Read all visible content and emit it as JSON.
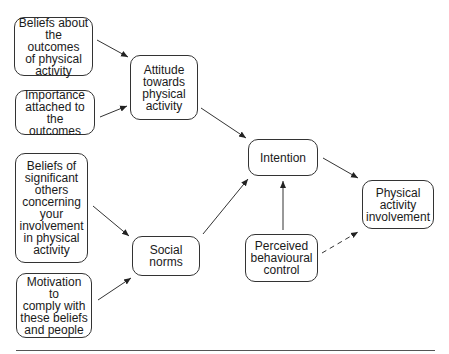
{
  "diagram": {
    "type": "flow diagram (Theory of Planned Behaviour applied to physical activity)",
    "nodes": {
      "beliefs_outcomes": {
        "label": "Beliefs about\nthe outcomes\nof physical\nactivity"
      },
      "importance": {
        "label": "Importance\nattached to\nthe outcomes"
      },
      "attitude": {
        "label": "Attitude\ntowards\nphysical\nactivity"
      },
      "beliefs_others": {
        "label": "Beliefs of\nsignificant\nothers\nconcerning\nyour\ninvolvement\nin physical\nactivity"
      },
      "motivation": {
        "label": "Motivation to\ncomply with\nthese beliefs\nand people"
      },
      "social_norms": {
        "label": "Social\nnorms"
      },
      "intention": {
        "label": "Intention"
      },
      "perceived_control": {
        "label": "Perceived\nbehavioural\ncontrol"
      },
      "involvement": {
        "label": "Physical\nactivity\ninvolvement"
      }
    },
    "edges": [
      {
        "from": "beliefs_outcomes",
        "to": "attitude",
        "style": "solid"
      },
      {
        "from": "importance",
        "to": "attitude",
        "style": "solid"
      },
      {
        "from": "beliefs_others",
        "to": "social_norms",
        "style": "solid"
      },
      {
        "from": "motivation",
        "to": "social_norms",
        "style": "solid"
      },
      {
        "from": "attitude",
        "to": "intention",
        "style": "solid"
      },
      {
        "from": "social_norms",
        "to": "intention",
        "style": "solid"
      },
      {
        "from": "perceived_control",
        "to": "intention",
        "style": "solid"
      },
      {
        "from": "intention",
        "to": "involvement",
        "style": "solid"
      },
      {
        "from": "perceived_control",
        "to": "involvement",
        "style": "dashed"
      }
    ]
  }
}
